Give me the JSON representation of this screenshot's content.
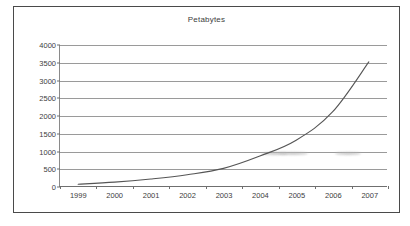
{
  "chart_data": {
    "type": "line",
    "title": "Petabytes",
    "xlabel": "",
    "ylabel": "",
    "categories": [
      "1999",
      "2000",
      "2001",
      "2002",
      "2003",
      "2004",
      "2005",
      "2006",
      "2007"
    ],
    "x": [
      1999,
      2000,
      2001,
      2002,
      2003,
      2004,
      2005,
      2006,
      2007
    ],
    "values": [
      50,
      110,
      200,
      320,
      500,
      850,
      1300,
      2100,
      3520
    ],
    "series": [
      {
        "name": "Petabytes",
        "values": [
          50,
          110,
          200,
          320,
          500,
          850,
          1300,
          2100,
          3520
        ]
      }
    ],
    "ylim": [
      0,
      4000
    ],
    "yticks": [
      0,
      500,
      1000,
      1500,
      2000,
      2500,
      3000,
      3500,
      4000
    ],
    "ytick_labels": [
      "0",
      "500",
      "1000",
      "1500",
      "2000",
      "2500",
      "3000",
      "3500",
      "4000"
    ],
    "grid": true,
    "legend": false,
    "legend_position": "none",
    "line_color": "#555555",
    "grid_color": "#9a9a9a",
    "axis_color": "#6f6f6f",
    "background_color": "#ffffff",
    "border_color": "#4a4a4a",
    "text_color": "#3d3d3d",
    "annotations": [
      {
        "name": "scan-smudge",
        "near_x": 2004.4,
        "near_y": 950
      },
      {
        "name": "scan-smudge",
        "near_x": 2004.9,
        "near_y": 950
      },
      {
        "name": "scan-smudge",
        "near_x": 2006.4,
        "near_y": 950
      }
    ]
  }
}
